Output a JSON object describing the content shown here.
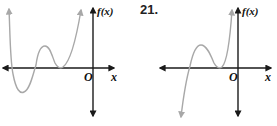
{
  "problem_number": "21.",
  "graphs": [
    {
      "id": "left",
      "y_axis_label": "f(x)",
      "x_axis_label": "x",
      "origin_label": "O",
      "description": "Even-degree polynomial: both ends rise, crosses x-axis twice, local max above axis, double root touching axis left of origin"
    },
    {
      "id": "right",
      "y_axis_label": "f(x)",
      "x_axis_label": "x",
      "origin_label": "O",
      "description": "Odd-degree polynomial: left end falls, right end rises, crosses x-axis once, local max above axis, double root touching axis left of origin"
    }
  ],
  "colors": {
    "axis": "#1a1a1a",
    "curve": "#a8a8a8"
  }
}
